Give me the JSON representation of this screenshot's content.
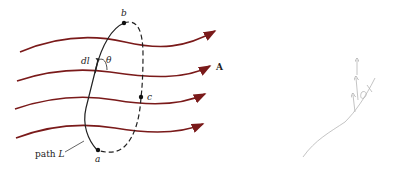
{
  "figure": {
    "field_label": "A",
    "point_a": "a",
    "point_b": "b",
    "point_c": "c",
    "element_label": "dl",
    "angle_label": "θ",
    "path_label_prefix": "path ",
    "path_label_var": "L"
  },
  "colors": {
    "field_lines": "#7a1a1a",
    "path": "#222222",
    "sketch": "#b0b0b0"
  },
  "sketch": {
    "description": "faint pencil sketch of arrows along a curve"
  }
}
